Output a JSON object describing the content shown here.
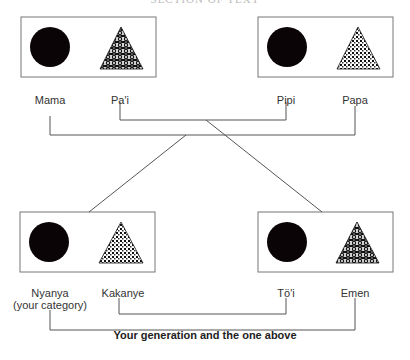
{
  "header": {
    "partial_text": "SECTION OF TEXT"
  },
  "diagram": {
    "colors": {
      "line": "#555555",
      "box_border": "#777777",
      "circle": "#0a0406",
      "pattern": "#111111"
    },
    "boxes": [
      {
        "id": "top-left",
        "shapes": [
          "filled-circle",
          "woven-triangle"
        ]
      },
      {
        "id": "top-right",
        "shapes": [
          "filled-circle",
          "dotted-triangle"
        ]
      },
      {
        "id": "bottom-left",
        "shapes": [
          "filled-circle",
          "dotted-triangle"
        ]
      },
      {
        "id": "bottom-right",
        "shapes": [
          "filled-circle",
          "woven-triangle"
        ]
      }
    ],
    "top_labels": {
      "mama": "Mama",
      "pai": "Pa'i",
      "pipi": "Pipi",
      "papa": "Papa"
    },
    "bottom_labels": {
      "nyanya": "Nyanya",
      "nyanya_note": "(your category)",
      "kakanye": "Kakanye",
      "toi": "Tö'i",
      "emen": "Emen"
    },
    "caption": "Your generation and the one above"
  }
}
